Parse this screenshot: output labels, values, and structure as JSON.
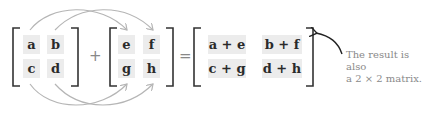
{
  "matrix_a": {
    "cells": [
      "a",
      "b",
      "c",
      "d"
    ]
  },
  "operator_plus": "+",
  "matrix_b": {
    "cells": [
      "e",
      "f",
      "g",
      "h"
    ]
  },
  "operator_equals": "=",
  "result_matrix": {
    "cells": [
      "a + e",
      "b + f",
      "c + g",
      "d + h"
    ]
  },
  "annotation": {
    "line1": "The result is also",
    "line2": "a 2 × 2 matrix."
  },
  "colors": {
    "bracket": "#333333",
    "arrow": "#b5b5b5",
    "cell_bg": "#ececec",
    "annotation_text": "#8a8a8a"
  }
}
